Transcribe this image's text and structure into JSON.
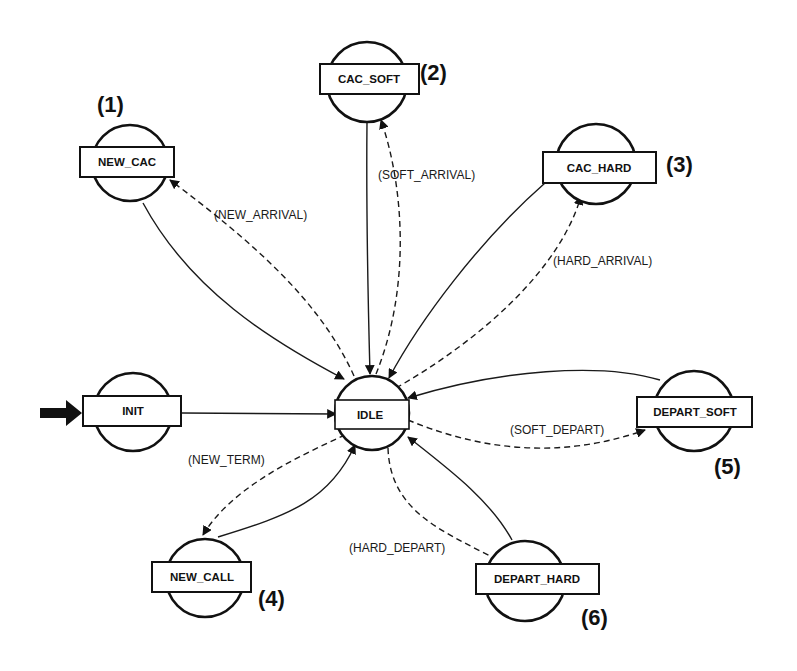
{
  "diagram": {
    "type": "state-transition-diagram",
    "initial_state": "INIT",
    "states": [
      {
        "id": "init",
        "label": "INIT",
        "number": ""
      },
      {
        "id": "idle",
        "label": "IDLE",
        "number": ""
      },
      {
        "id": "new_cac",
        "label": "NEW_CAC",
        "number": "(1)"
      },
      {
        "id": "cac_soft",
        "label": "CAC_SOFT",
        "number": "(2)"
      },
      {
        "id": "cac_hard",
        "label": "CAC_HARD",
        "number": "(3)"
      },
      {
        "id": "new_call",
        "label": "NEW_CALL",
        "number": "(4)"
      },
      {
        "id": "depart_soft",
        "label": "DEPART_SOFT",
        "number": "(5)"
      },
      {
        "id": "depart_hard",
        "label": "DEPART_HARD",
        "number": "(6)"
      }
    ],
    "transitions": [
      {
        "from": "INIT",
        "to": "IDLE",
        "style": "solid",
        "label": ""
      },
      {
        "from": "IDLE",
        "to": "NEW_CAC",
        "style": "dashed",
        "label": "(NEW_ARRIVAL)"
      },
      {
        "from": "NEW_CAC",
        "to": "IDLE",
        "style": "solid",
        "label": ""
      },
      {
        "from": "IDLE",
        "to": "CAC_SOFT",
        "style": "dashed",
        "label": "(SOFT_ARRIVAL)"
      },
      {
        "from": "CAC_SOFT",
        "to": "IDLE",
        "style": "solid",
        "label": ""
      },
      {
        "from": "IDLE",
        "to": "CAC_HARD",
        "style": "dashed",
        "label": "(HARD_ARRIVAL)"
      },
      {
        "from": "CAC_HARD",
        "to": "IDLE",
        "style": "solid",
        "label": ""
      },
      {
        "from": "IDLE",
        "to": "NEW_CALL",
        "style": "dashed",
        "label": "(NEW_TERM)"
      },
      {
        "from": "NEW_CALL",
        "to": "IDLE",
        "style": "solid",
        "label": ""
      },
      {
        "from": "IDLE",
        "to": "DEPART_SOFT",
        "style": "dashed",
        "label": "(SOFT_DEPART)"
      },
      {
        "from": "DEPART_SOFT",
        "to": "IDLE",
        "style": "solid",
        "label": ""
      },
      {
        "from": "IDLE",
        "to": "DEPART_HARD",
        "style": "dashed",
        "label": "(HARD_DEPART)"
      },
      {
        "from": "DEPART_HARD",
        "to": "IDLE",
        "style": "solid",
        "label": ""
      }
    ],
    "edge_labels": {
      "new_arrival": "(NEW_ARRIVAL)",
      "soft_arrival": "(SOFT_ARRIVAL)",
      "hard_arrival": "(HARD_ARRIVAL)",
      "new_term": "(NEW_TERM)",
      "soft_depart": "(SOFT_DEPART)",
      "hard_depart": "(HARD_DEPART)"
    },
    "colors": {
      "stroke": "#111111",
      "background": "#ffffff"
    }
  }
}
